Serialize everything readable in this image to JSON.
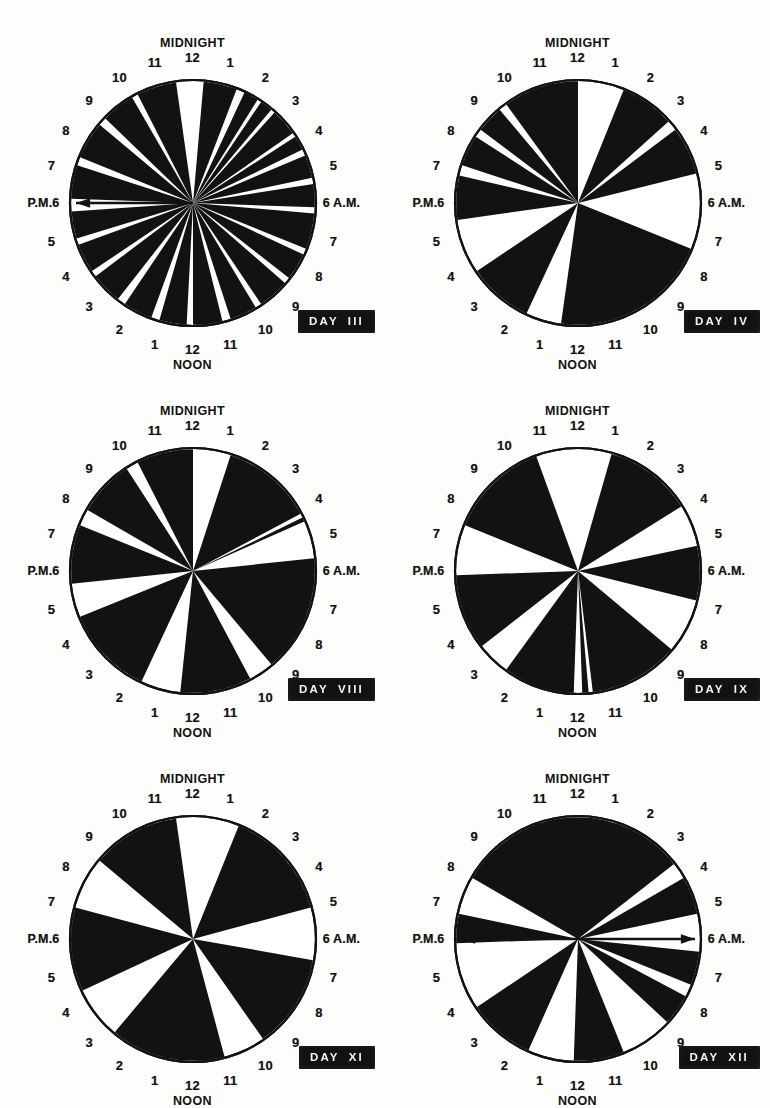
{
  "figure": {
    "dial_count": 6,
    "legend": {
      "black_meaning": "sleep / rest period (shaded sector)",
      "white_meaning": "wakefulness / activity (open sector)"
    }
  },
  "labels": {
    "midnight": "MIDNIGHT",
    "noon": "NOON",
    "pm6": "P.M.6",
    "am6": "6 A.M.",
    "day_word": "DAY",
    "hours_right": [
      "1",
      "2",
      "3",
      "4",
      "5"
    ],
    "hours_bottom_right": [
      "7",
      "8",
      "9",
      "10",
      "11"
    ],
    "hours_bottom_left": [
      "1",
      "2",
      "3",
      "4",
      "5"
    ],
    "hours_left": [
      "7",
      "8",
      "9",
      "10",
      "11"
    ],
    "noon_bottom_hour": "12",
    "midnight_top_hour": "12"
  },
  "ring_hours": [
    {
      "h": "12",
      "deg": 0
    },
    {
      "h": "1",
      "deg": 15
    },
    {
      "h": "2",
      "deg": 30
    },
    {
      "h": "3",
      "deg": 45
    },
    {
      "h": "4",
      "deg": 60
    },
    {
      "h": "5",
      "deg": 75
    },
    {
      "h": "6 A.M.",
      "deg": 90
    },
    {
      "h": "7",
      "deg": 105
    },
    {
      "h": "8",
      "deg": 120
    },
    {
      "h": "9",
      "deg": 135
    },
    {
      "h": "10",
      "deg": 150
    },
    {
      "h": "11",
      "deg": 165
    },
    {
      "h": "12",
      "deg": 180
    },
    {
      "h": "1",
      "deg": 195
    },
    {
      "h": "2",
      "deg": 210
    },
    {
      "h": "3",
      "deg": 225
    },
    {
      "h": "4",
      "deg": 240
    },
    {
      "h": "5",
      "deg": 255
    },
    {
      "h": "P.M.6",
      "deg": 270
    },
    {
      "h": "7",
      "deg": 285
    },
    {
      "h": "8",
      "deg": 300
    },
    {
      "h": "9",
      "deg": 315
    },
    {
      "h": "10",
      "deg": 330
    },
    {
      "h": "11",
      "deg": 345
    }
  ],
  "chart_data": [
    {
      "type": "pie",
      "title": "DAY III",
      "day_number": "III",
      "units": "hours of a 24-hour clock, 12 = midnight at top, clockwise",
      "arrow": {
        "present": true,
        "from_deg": 270,
        "label": "P.M.6",
        "direction": "outward-left"
      },
      "black_sectors_deg": [
        [
          5,
          21
        ],
        [
          25,
          32
        ],
        [
          34,
          40
        ],
        [
          42,
          55
        ],
        [
          57,
          64
        ],
        [
          67,
          78
        ],
        [
          81,
          92
        ],
        [
          95,
          112
        ],
        [
          115,
          128
        ],
        [
          131,
          146
        ],
        [
          149,
          162
        ],
        [
          166,
          180
        ],
        [
          183,
          196
        ],
        [
          200,
          214
        ],
        [
          218,
          233
        ],
        [
          236,
          250
        ],
        [
          253,
          266
        ],
        [
          272,
          288
        ],
        [
          292,
          310
        ],
        [
          314,
          330
        ],
        [
          333,
          352
        ]
      ],
      "sector_count": 21
    },
    {
      "type": "pie",
      "title": "DAY IV",
      "day_number": "IV",
      "units": "hours of a 24-hour clock, 12 = midnight at top, clockwise",
      "arrow": {
        "present": false
      },
      "black_sectors_deg": [
        [
          22,
          48
        ],
        [
          53,
          76
        ],
        [
          112,
          188
        ],
        [
          205,
          236
        ],
        [
          262,
          283
        ],
        [
          288,
          303
        ],
        [
          307,
          320
        ],
        [
          324,
          360
        ]
      ],
      "sector_count": 8
    },
    {
      "type": "pie",
      "title": "DAY VIII",
      "day_number": "VIII",
      "units": "hours of a 24-hour clock, 12 = midnight at top, clockwise",
      "arrow": {
        "present": false
      },
      "black_sectors_deg": [
        [
          18,
          62
        ],
        [
          64,
          66
        ],
        [
          84,
          140
        ],
        [
          152,
          186
        ],
        [
          205,
          248
        ],
        [
          264,
          292
        ],
        [
          300,
          327
        ],
        [
          333,
          360
        ]
      ],
      "sector_count": 8
    },
    {
      "type": "pie",
      "title": "DAY IX",
      "day_number": "IX",
      "units": "hours of a 24-hour clock, 12 = midnight at top, clockwise",
      "arrow": {
        "present": false
      },
      "black_sectors_deg": [
        [
          16,
          58
        ],
        [
          78,
          104
        ],
        [
          130,
          173
        ],
        [
          175,
          178
        ],
        [
          182,
          216
        ],
        [
          232,
          268
        ],
        [
          292,
          340
        ]
      ],
      "sector_count": 7
    },
    {
      "type": "pie",
      "title": "DAY XI",
      "day_number": "XI",
      "units": "hours of a 24-hour clock, 12 = midnight at top, clockwise",
      "arrow": {
        "present": false
      },
      "black_sectors_deg": [
        [
          22,
          75
        ],
        [
          100,
          145
        ],
        [
          165,
          220
        ],
        [
          245,
          285
        ],
        [
          310,
          352
        ]
      ],
      "sector_count": 5
    },
    {
      "type": "pie",
      "title": "DAY XII",
      "day_number": "XII",
      "units": "hours of a 24-hour clock, 12 = midnight at top, clockwise",
      "arrow": {
        "present": true,
        "from_deg": 90,
        "label": "6 A.M.",
        "direction": "outward-both"
      },
      "black_sectors_deg": [
        [
          300,
          360
        ],
        [
          0,
          52
        ],
        [
          60,
          78
        ],
        [
          96,
          112
        ],
        [
          118,
          133
        ],
        [
          158,
          182
        ],
        [
          204,
          236
        ],
        [
          268,
          282
        ]
      ],
      "sector_count": 8
    }
  ],
  "colors": {
    "ink": "#121212",
    "paper": "#fdfdfb",
    "plate_bg": "#121212",
    "plate_text": "#f4f4f0"
  }
}
